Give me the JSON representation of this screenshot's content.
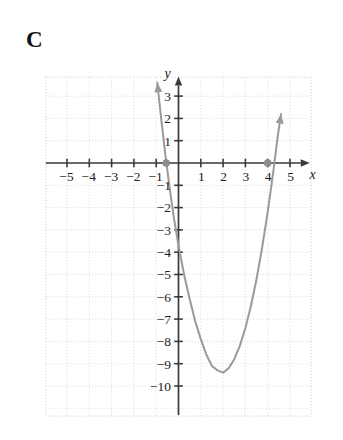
{
  "figure": {
    "panel_label": "C",
    "background_color": "#ffffff"
  },
  "axes": {
    "x_axis_label": "x",
    "y_axis_label": "y",
    "x_ticklabels": [
      "-5",
      "-4",
      "-3",
      "-2",
      "-1",
      "1",
      "2",
      "3",
      "4",
      "5"
    ],
    "y_ticklabels": [
      "3",
      "2",
      "1",
      "-1",
      "-2",
      "-3",
      "-4",
      "-5",
      "-6",
      "-7",
      "-8",
      "-9",
      "-10"
    ],
    "axis_color": "#3a3a3a",
    "grid_color": "#cfcfcf",
    "curve_color": "#9a9a9a",
    "marker_color": "#8c8c8c"
  },
  "chart_data": {
    "type": "line",
    "title": "C",
    "xlabel": "x",
    "ylabel": "y",
    "xlim": [
      -5.8,
      5.8
    ],
    "ylim": [
      -11.0,
      4.0
    ],
    "xticks": [
      -5,
      -4,
      -3,
      -2,
      -1,
      1,
      2,
      3,
      4,
      5
    ],
    "yticks": [
      3,
      2,
      1,
      -1,
      -2,
      -3,
      -4,
      -5,
      -6,
      -7,
      -8,
      -9,
      -10
    ],
    "grid": true,
    "grid_spacing": 1,
    "legend": "none",
    "series": [
      {
        "name": "parabola",
        "kind": "quadratic",
        "equation": "y = 1.8(x + 0.55)(x - 4)",
        "roots": [
          -0.55,
          4
        ],
        "vertex": [
          1.5,
          -10.1
        ],
        "opens": "up",
        "arrow_ends": [
          "up-left",
          "up-right"
        ],
        "x": [
          -0.95,
          -0.8,
          -0.6,
          -0.4,
          -0.2,
          0,
          0.25,
          0.5,
          0.75,
          1,
          1.25,
          1.5,
          1.75,
          2,
          2.25,
          2.5,
          2.75,
          3,
          3.25,
          3.5,
          3.75,
          4,
          4.25,
          4.45,
          4.6
        ],
        "y": [
          3.6,
          2.2,
          0.45,
          -1.1,
          -2.5,
          -3.7,
          -5.0,
          -6.1,
          -7.1,
          -7.9,
          -8.6,
          -9.1,
          -9.3,
          -9.4,
          -9.2,
          -8.8,
          -8.2,
          -7.4,
          -6.4,
          -5.2,
          -3.8,
          -2.2,
          -0.4,
          1.2,
          2.2
        ]
      }
    ],
    "markers": [
      {
        "label": "left-root",
        "x": -0.55,
        "y": 0
      },
      {
        "label": "right-root",
        "x": 4,
        "y": 0
      }
    ]
  }
}
